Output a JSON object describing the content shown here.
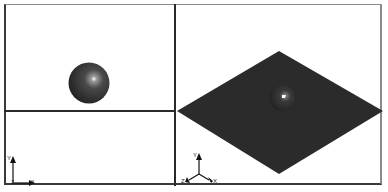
{
  "viewports": [
    {
      "name": "front-view",
      "objects": [
        "sphere"
      ],
      "axes": {
        "labels": [
          "Y",
          "X",
          "Z"
        ]
      }
    },
    {
      "name": "top-view",
      "objects": [],
      "axes": null
    },
    {
      "name": "isometric-view",
      "objects": [
        "ground-plane",
        "sphere"
      ],
      "axes": {
        "labels": [
          "Y",
          "Z",
          "X"
        ]
      }
    }
  ],
  "axes_front": {
    "y": "Y",
    "x": "X",
    "z": "Z"
  },
  "axes_iso": {
    "y": "Y",
    "x": "X",
    "z": "Z"
  },
  "colors": {
    "plane": "#2b2b2b",
    "sphere": "#333333",
    "border": "#2a2a2a",
    "background": "#ffffff"
  }
}
